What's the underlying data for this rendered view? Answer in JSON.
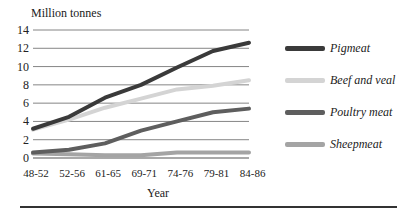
{
  "chart_data": {
    "type": "line",
    "title": "",
    "ylabel": "Million tonnes",
    "xlabel": "Year",
    "ylim": [
      0,
      14
    ],
    "yticks": [
      0,
      2,
      4,
      6,
      8,
      10,
      12,
      14
    ],
    "grid": true,
    "legend_position": "right",
    "categories": [
      "48-52",
      "52-56",
      "61-65",
      "69-71",
      "74-76",
      "79-81",
      "84-86"
    ],
    "series": [
      {
        "name": "Pigmeat",
        "color": "#3a3a3a",
        "values": [
          3.2,
          4.5,
          6.6,
          8.0,
          9.9,
          11.7,
          12.6
        ]
      },
      {
        "name": "Beef and veal",
        "color": "#d4d4d4",
        "values": [
          3.1,
          4.2,
          5.5,
          6.5,
          7.5,
          7.9,
          8.5
        ]
      },
      {
        "name": "Poultry meat",
        "color": "#5e5e5e",
        "values": [
          0.6,
          0.9,
          1.6,
          3.0,
          4.0,
          5.0,
          5.4
        ]
      },
      {
        "name": "Sheepmeat",
        "color": "#a4a4a4",
        "values": [
          0.5,
          0.4,
          0.3,
          0.3,
          0.6,
          0.6,
          0.6
        ]
      }
    ]
  }
}
